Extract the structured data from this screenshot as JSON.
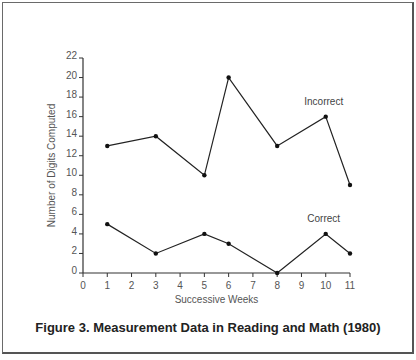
{
  "caption": "Figure 3. Measurement Data in Reading and Math (1980)",
  "chart_data": {
    "type": "line",
    "title": "Figure 3. Measurement Data in Reading and Math (1980)",
    "xlabel": "Successive Weeks",
    "ylabel": "Number of Digits Computed",
    "xlim": [
      0,
      11
    ],
    "ylim": [
      0,
      22
    ],
    "xticks": [
      0,
      1,
      2,
      3,
      4,
      5,
      6,
      7,
      8,
      9,
      10,
      11
    ],
    "yticks": [
      0,
      2,
      4,
      6,
      8,
      10,
      12,
      14,
      16,
      18,
      20,
      22
    ],
    "grid": false,
    "legend": "inline labels",
    "series": [
      {
        "name": "Incorrect",
        "x": [
          1,
          3,
          5,
          6,
          8,
          10,
          11
        ],
        "values": [
          13,
          14,
          10,
          20,
          13,
          16,
          9
        ],
        "label_near": "top-right"
      },
      {
        "name": "Correct",
        "x": [
          1,
          3,
          5,
          6,
          8,
          10,
          11
        ],
        "values": [
          5,
          2,
          4,
          3,
          0,
          4,
          2
        ],
        "label_near": "bottom-right"
      }
    ]
  }
}
